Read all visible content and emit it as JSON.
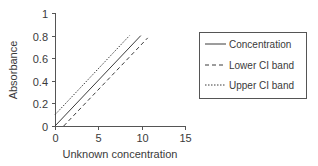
{
  "chart_data": {
    "type": "line",
    "title": "",
    "xlabel": "Unknown concentration",
    "ylabel": "Absorbance",
    "xlim": [
      0,
      15
    ],
    "ylim": [
      0,
      1
    ],
    "xticks": [
      0,
      5,
      10,
      15
    ],
    "yticks": [
      0,
      0.2,
      0.4,
      0.6,
      0.8,
      1
    ],
    "xtick_labels": [
      "0",
      "5",
      "10",
      "15"
    ],
    "ytick_labels": [
      "0",
      "0.2",
      "0.4",
      "0.6",
      "0.8",
      "1"
    ],
    "grid": false,
    "legend_position": "right",
    "series": [
      {
        "name": "Concentration",
        "style": "solid",
        "color": "#3a3a3a",
        "x": [
          0,
          9.9
        ],
        "y": [
          0,
          0.8
        ]
      },
      {
        "name": "Lower CI band",
        "style": "dashed",
        "color": "#3a3a3a",
        "x": [
          1.0,
          10.7
        ],
        "y": [
          0,
          0.78
        ]
      },
      {
        "name": "Upper CI band",
        "style": "dotted",
        "color": "#3a3a3a",
        "x": [
          0,
          8.6
        ],
        "y": [
          0.1,
          0.8
        ]
      }
    ]
  },
  "legend": {
    "items": [
      {
        "label": "Concentration"
      },
      {
        "label": "Lower CI band"
      },
      {
        "label": "Upper CI band"
      }
    ]
  }
}
